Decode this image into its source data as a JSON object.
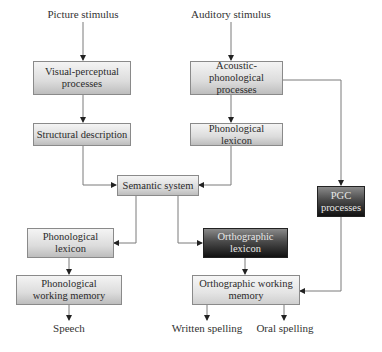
{
  "diagram": {
    "inputs": {
      "picture": "Picture stimulus",
      "auditory": "Auditory stimulus"
    },
    "boxes": {
      "visual_perceptual": {
        "line1": "Visual-perceptual",
        "line2": "processes"
      },
      "structural_description": {
        "line1": "Structural description"
      },
      "acoustic_phonological": {
        "line1": "Acoustic-phonological",
        "line2": "processes"
      },
      "phonological_lexicon_input": {
        "line1": "Phonological lexicon"
      },
      "semantic_system": {
        "line1": "Semantic system"
      },
      "pgc": {
        "line1": "PGC",
        "line2": "processes"
      },
      "phonological_lexicon_output": {
        "line1": "Phonological",
        "line2": "lexicon"
      },
      "orthographic_lexicon": {
        "line1": "Orthographic",
        "line2": "lexicon"
      },
      "phonological_working_memory": {
        "line1": "Phonological",
        "line2": "working memory"
      },
      "orthographic_working_memory": {
        "line1": "Orthographic working",
        "line2": "memory"
      }
    },
    "outputs": {
      "speech": "Speech",
      "written": "Written spelling",
      "oral": "Oral spelling"
    },
    "colors": {
      "light_box_top": "#f4f4f4",
      "light_box_bottom": "#bdbdbd",
      "dark_box_top": "#8a8a8a",
      "dark_box_bottom": "#111111",
      "line": "#7a7a7a"
    }
  }
}
